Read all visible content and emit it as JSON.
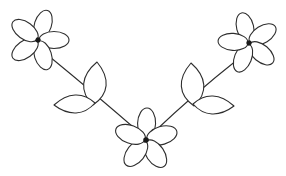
{
  "artwork": {
    "title": "Floral Vine Line Drawing",
    "description": "Symmetric V-shaped floral spray with three five-petal flowers and four leaves",
    "width": 286,
    "height": 176,
    "background_color": "#ffffff",
    "stroke_color": "#2e2e2e",
    "center_color": "#1a1a1a",
    "stroke_width": 1.1,
    "style": "outline-line-art"
  },
  "chart_data": {
    "type": "diagram",
    "title": "Floral Vine Line Drawing",
    "elements": {
      "flowers": [
        {
          "name": "upper-left-flower",
          "center_x": 38,
          "center_y": 40,
          "petal_count": 5,
          "petal_length": 30,
          "petal_width": 17,
          "rotation_deg": 18,
          "center_dot_radius": 2.6
        },
        {
          "name": "upper-right-flower",
          "center_x": 249,
          "center_y": 43,
          "petal_count": 5,
          "petal_length": 30,
          "petal_width": 17,
          "rotation_deg": -14,
          "center_dot_radius": 2.6
        },
        {
          "name": "bottom-center-flower",
          "center_x": 146,
          "center_y": 140,
          "petal_count": 5,
          "petal_length": 31,
          "petal_width": 18,
          "rotation_deg": 2,
          "center_dot_radius": 2.8
        }
      ],
      "stems": [
        {
          "name": "left-stem",
          "from_x": 50,
          "from_y": 57,
          "to_x": 140,
          "to_y": 133,
          "curve_x": 94,
          "curve_y": 93
        },
        {
          "name": "right-stem",
          "from_x": 237,
          "from_y": 60,
          "to_x": 153,
          "to_y": 133,
          "curve_x": 194,
          "curve_y": 94
        }
      ],
      "leaves": [
        {
          "name": "left-upper-leaf",
          "tip_x": 97,
          "tip_y": 62,
          "base_x": 93,
          "base_y": 105,
          "bulge": 15
        },
        {
          "name": "left-lower-leaf",
          "tip_x": 54,
          "tip_y": 105,
          "base_x": 95,
          "base_y": 103,
          "bulge": 12
        },
        {
          "name": "right-upper-leaf",
          "tip_x": 191,
          "tip_y": 63,
          "base_x": 194,
          "base_y": 106,
          "bulge": 15
        },
        {
          "name": "right-lower-leaf",
          "tip_x": 234,
          "tip_y": 106,
          "base_x": 193,
          "base_y": 104,
          "bulge": 12
        }
      ]
    },
    "counts": {
      "flowers": 3,
      "leaves": 4,
      "stems": 2,
      "petals_per_flower": 5,
      "total_petals": 15
    }
  }
}
